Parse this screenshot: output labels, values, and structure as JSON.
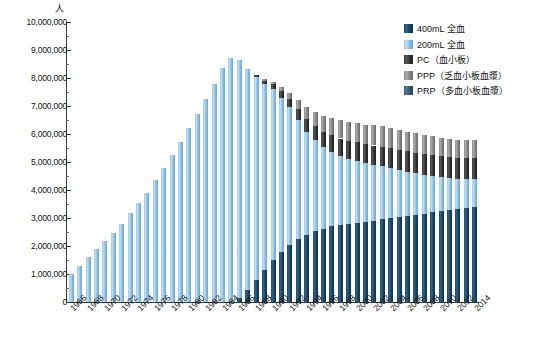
{
  "unit_label": "人",
  "legend": {
    "items": [
      {
        "label": "400mL 全血",
        "color": "#1d4d70",
        "key": "w400"
      },
      {
        "label": "200mL 全血",
        "color": "#9ccbe9",
        "key": "w200"
      },
      {
        "label": "PC（血小板）",
        "color": "#3b3b3b",
        "key": "pc"
      },
      {
        "label": "PPP（乏血小板血漿）",
        "color": "#8e8e8e",
        "key": "ppp"
      },
      {
        "label": "PRP（多血小板血漿）",
        "color": "#3d5f7e",
        "key": "prp"
      }
    ]
  },
  "axes": {
    "y_ticks": [
      "0",
      "1,000,000",
      "2,000,000",
      "3,000,000",
      "4,000,000",
      "5,000,000",
      "6,000,000",
      "7,000,000",
      "8,000,000",
      "9,000,000",
      "10,000,000"
    ],
    "y_min": 0,
    "y_max": 10000000,
    "y_step": 1000000,
    "x_tick_labels": [
      "1966",
      "1968",
      "1970",
      "1972",
      "1974",
      "1976",
      "1978",
      "1980",
      "1982",
      "1984",
      "1986",
      "1988",
      "1990",
      "1992",
      "1994",
      "1996",
      "1998",
      "2000",
      "2002",
      "2004",
      "2006",
      "2008",
      "2010",
      "2012",
      "2014"
    ]
  },
  "chart_data": {
    "type": "bar",
    "stacked": true,
    "title": "",
    "subtitle": "",
    "xlabel": "",
    "ylabel": "人",
    "ylim": [
      0,
      10000000
    ],
    "grid": false,
    "legend_position": "top-right",
    "categories": [
      "1966",
      "1967",
      "1968",
      "1969",
      "1970",
      "1971",
      "1972",
      "1973",
      "1974",
      "1975",
      "1976",
      "1977",
      "1978",
      "1979",
      "1980",
      "1981",
      "1982",
      "1983",
      "1984",
      "1985",
      "1986",
      "1987",
      "1988",
      "1989",
      "1990",
      "1991",
      "1992",
      "1993",
      "1994",
      "1995",
      "1996",
      "1997",
      "1998",
      "1999",
      "2000",
      "2001",
      "2002",
      "2003",
      "2004",
      "2005",
      "2006",
      "2007",
      "2008",
      "2009",
      "2010",
      "2011",
      "2012",
      "2013",
      "2014"
    ],
    "series": [
      {
        "name": "400mL 全血",
        "color": "#1d4d70",
        "values": [
          0,
          0,
          0,
          0,
          0,
          0,
          0,
          0,
          0,
          0,
          0,
          0,
          0,
          0,
          0,
          0,
          0,
          0,
          0,
          0,
          150000,
          420000,
          800000,
          1150000,
          1500000,
          1800000,
          2050000,
          2250000,
          2380000,
          2520000,
          2620000,
          2700000,
          2760000,
          2800000,
          2830000,
          2850000,
          2900000,
          2950000,
          3000000,
          3020000,
          3060000,
          3100000,
          3150000,
          3200000,
          3260000,
          3300000,
          3330000,
          3360000,
          3380000
        ]
      },
      {
        "name": "200mL 全血",
        "color": "#9ccbe9",
        "values": [
          1000000,
          1300000,
          1600000,
          1880000,
          2180000,
          2480000,
          2800000,
          3180000,
          3520000,
          3900000,
          4350000,
          4800000,
          5250000,
          5700000,
          6200000,
          6700000,
          7250000,
          7800000,
          8350000,
          8700000,
          8500000,
          7900000,
          7250000,
          6650000,
          6100000,
          5500000,
          4900000,
          4250000,
          3700000,
          3250000,
          2900000,
          2650000,
          2450000,
          2300000,
          2200000,
          2100000,
          2000000,
          1900000,
          1800000,
          1700000,
          1600000,
          1500000,
          1400000,
          1300000,
          1200000,
          1120000,
          1060000,
          1020000,
          1000000
        ]
      },
      {
        "name": "PC（血小板）",
        "color": "#3b3b3b",
        "values": [
          0,
          0,
          0,
          0,
          0,
          0,
          0,
          0,
          0,
          0,
          0,
          0,
          0,
          0,
          0,
          0,
          0,
          0,
          0,
          0,
          0,
          0,
          60000,
          110000,
          170000,
          230000,
          300000,
          380000,
          450000,
          510000,
          560000,
          600000,
          630000,
          650000,
          670000,
          680000,
          690000,
          700000,
          710000,
          715000,
          720000,
          725000,
          730000,
          735000,
          740000,
          745000,
          750000,
          755000,
          760000
        ]
      },
      {
        "name": "PPP（乏血小板血漿）",
        "color": "#8e8e8e",
        "values": [
          0,
          0,
          0,
          0,
          0,
          0,
          0,
          0,
          0,
          0,
          0,
          0,
          0,
          0,
          0,
          0,
          0,
          0,
          0,
          0,
          0,
          0,
          0,
          40000,
          90000,
          150000,
          230000,
          330000,
          420000,
          500000,
          560000,
          610000,
          650000,
          680000,
          700000,
          710000,
          715000,
          720000,
          720000,
          715000,
          710000,
          700000,
          690000,
          680000,
          670000,
          660000,
          650000,
          645000,
          640000
        ]
      },
      {
        "name": "PRP（多血小板血漿）",
        "color": "#3d5f7e",
        "values": [
          0,
          0,
          0,
          0,
          0,
          0,
          0,
          0,
          0,
          0,
          0,
          0,
          0,
          0,
          0,
          0,
          0,
          0,
          0,
          0,
          0,
          0,
          0,
          0,
          0,
          0,
          0,
          0,
          0,
          0,
          0,
          0,
          0,
          0,
          0,
          0,
          0,
          0,
          0,
          0,
          0,
          0,
          0,
          0,
          0,
          0,
          0,
          0,
          0
        ]
      }
    ]
  }
}
